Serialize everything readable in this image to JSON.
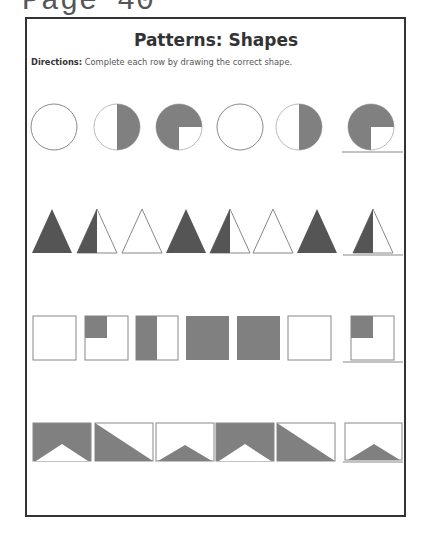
{
  "page_label": "Page 40",
  "worksheet": {
    "title": "Patterns: Shapes",
    "directions_label": "Directions:",
    "directions_text": " Complete each row by drawing the correct shape."
  },
  "colors": {
    "fill": "#808080",
    "dark_fill": "#555555",
    "stroke": "#888888",
    "frame": "#333333"
  },
  "rows": [
    {
      "shape": "circle",
      "items": [
        "empty",
        "right-half",
        "three-quarters",
        "empty",
        "right-half",
        "three-quarters"
      ],
      "answer_index": 5
    },
    {
      "shape": "triangle",
      "items": [
        "full",
        "left-half",
        "empty",
        "full",
        "left-half",
        "empty",
        "full",
        "left-half"
      ],
      "answer_index": 7
    },
    {
      "shape": "square",
      "items": [
        "empty",
        "top-left-quarter",
        "left-half",
        "full",
        "full",
        "empty",
        "top-left-quarter"
      ],
      "answer_index": 6
    },
    {
      "shape": "rectangle",
      "items": [
        "notch-bottom",
        "diagonal-lower",
        "small-peak",
        "notch-bottom",
        "diagonal-lower",
        "small-peak"
      ],
      "answer_index": 5
    }
  ]
}
